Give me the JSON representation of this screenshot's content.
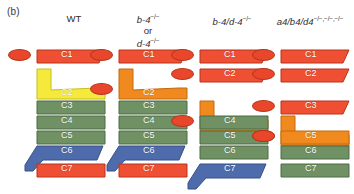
{
  "figure": {
    "panel_label": "(b)",
    "colors": {
      "red": "#ef4f32",
      "orange": "#f08a1e",
      "yellow": "#f5e93c",
      "green": "#6f9163",
      "blue": "#4e6bab",
      "oval": "#e8472b",
      "outline_red": "#b8351d",
      "outline_orange": "#c06a10",
      "outline_yellow": "#c9bf20",
      "outline_green": "#4f6a46",
      "outline_blue": "#36508a"
    },
    "columns": [
      {
        "id": "wt",
        "header": "WT",
        "header_lines": [
          "WT"
        ],
        "ovals": 1,
        "segments": [
          {
            "label": "C1",
            "color": "red",
            "shape": "slant"
          },
          {
            "label": "C2",
            "color": "yellow",
            "shape": "notch"
          },
          {
            "label": "C3",
            "color": "green",
            "shape": "plain"
          },
          {
            "label": "C4",
            "color": "green",
            "shape": "plain"
          },
          {
            "label": "C5",
            "color": "green",
            "shape": "plain"
          },
          {
            "label": "C6",
            "color": "blue",
            "shape": "tail"
          },
          {
            "label": "C7",
            "color": "red",
            "shape": "plain"
          }
        ]
      },
      {
        "id": "b4-or-d4",
        "header": "b-4-/- or d-4-/-",
        "header_lines": [
          "b-4",
          "or",
          "d-4"
        ],
        "ovals": 2,
        "segments": [
          {
            "label": "C1",
            "color": "red",
            "shape": "slant"
          },
          {
            "label": "C2",
            "color": "orange",
            "shape": "notch"
          },
          {
            "label": "C3",
            "color": "green",
            "shape": "plain"
          },
          {
            "label": "C4",
            "color": "green",
            "shape": "plain"
          },
          {
            "label": "C5",
            "color": "green",
            "shape": "plain"
          },
          {
            "label": "C6",
            "color": "blue",
            "shape": "tail"
          },
          {
            "label": "C7",
            "color": "red",
            "shape": "plain"
          }
        ]
      },
      {
        "id": "b4-d4",
        "header": "b-4-/- / d-4-/-",
        "header_lines": [
          "b-4/d-4"
        ],
        "ovals": 3,
        "segments": [
          {
            "label": "C1",
            "color": "red",
            "shape": "slant"
          },
          {
            "label": "C2",
            "color": "red",
            "shape": "slant"
          },
          {
            "label": "C3",
            "color": "orange",
            "shape": "notch"
          },
          {
            "label": "C4",
            "color": "green",
            "shape": "plain"
          },
          {
            "label": "C5",
            "color": "green",
            "shape": "plain"
          },
          {
            "label": "C6",
            "color": "green",
            "shape": "plain"
          },
          {
            "label": "C7",
            "color": "blue",
            "shape": "tail"
          }
        ]
      },
      {
        "id": "a4-b4-d4",
        "header": "a4 / b4 / d4 -/-,-/-,-/-",
        "header_lines": [
          "a4/b4/d4"
        ],
        "ovals": 5,
        "segments": [
          {
            "label": "C1",
            "color": "red",
            "shape": "slant"
          },
          {
            "label": "C2",
            "color": "red",
            "shape": "slant"
          },
          {
            "label": "C3",
            "color": "red",
            "shape": "slant"
          },
          {
            "label": "C4",
            "color": "orange",
            "shape": "notch"
          },
          {
            "label": "C5",
            "color": "orange",
            "shape": "plain"
          },
          {
            "label": "C6",
            "color": "green",
            "shape": "plain"
          },
          {
            "label": "C7",
            "color": "green",
            "shape": "plain"
          }
        ]
      }
    ]
  }
}
